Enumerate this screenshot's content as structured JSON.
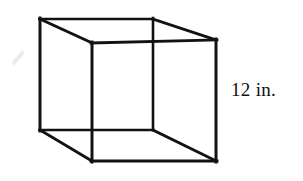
{
  "figure": {
    "kind": "3d-cube-wireframe",
    "stroke_color": "#121212",
    "background_color": "#ffffff",
    "stroke_width_outer": 3,
    "stroke_width_inner": 2.4,
    "vertices": {
      "back_top_left": [
        40,
        19
      ],
      "back_top_right": [
        153,
        19
      ],
      "back_bottom_right": [
        153,
        130
      ],
      "back_bottom_left": [
        40,
        130
      ],
      "front_top_left": [
        92,
        43
      ],
      "front_top_right": [
        216,
        40
      ],
      "front_bottom_right": [
        216,
        161
      ],
      "front_bottom_left": [
        92,
        161
      ]
    },
    "edges": [
      {
        "name": "back-top",
        "from": "back_top_left",
        "to": "back_top_right"
      },
      {
        "name": "back-right",
        "from": "back_top_right",
        "to": "back_bottom_right"
      },
      {
        "name": "back-bottom",
        "from": "back_bottom_right",
        "to": "back_bottom_left"
      },
      {
        "name": "back-left",
        "from": "back_bottom_left",
        "to": "back_top_left"
      },
      {
        "name": "front-top",
        "from": "front_top_left",
        "to": "front_top_right"
      },
      {
        "name": "front-right",
        "from": "front_top_right",
        "to": "front_bottom_right"
      },
      {
        "name": "front-bottom",
        "from": "front_bottom_right",
        "to": "front_bottom_left"
      },
      {
        "name": "front-left",
        "from": "front_bottom_left",
        "to": "front_top_left"
      },
      {
        "name": "connector-top-left",
        "from": "back_top_left",
        "to": "front_top_left"
      },
      {
        "name": "connector-top-right",
        "from": "back_top_right",
        "to": "front_top_right"
      },
      {
        "name": "connector-bottom-left",
        "from": "back_bottom_left",
        "to": "front_bottom_left"
      },
      {
        "name": "connector-bottom-right",
        "from": "back_bottom_right",
        "to": "front_bottom_right"
      }
    ]
  },
  "labels": {
    "edge_length": "12 in."
  }
}
